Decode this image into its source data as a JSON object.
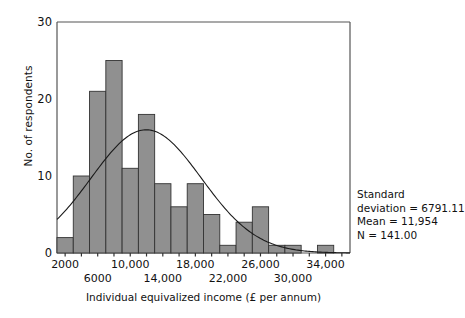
{
  "chart_data": {
    "type": "bar",
    "title": "",
    "subtitle": "",
    "xlabel": "Individual equivalized income (£ per annum)",
    "ylabel": "No. of respondents",
    "grid": false,
    "legend": "none",
    "histogram": true,
    "bin_width": 2000,
    "xlim": [
      1000,
      37000
    ],
    "ylim": [
      0,
      30
    ],
    "yticks": [
      0,
      10,
      20,
      30
    ],
    "ytick_labels": [
      "0",
      "10",
      "20",
      "30"
    ],
    "xticks": [
      2000,
      4000,
      6000,
      8000,
      10000,
      12000,
      14000,
      16000,
      18000,
      20000,
      22000,
      24000,
      26000,
      28000,
      30000,
      32000,
      34000,
      36000
    ],
    "xtick_labels_shown": [
      {
        "value": 2000,
        "label": "2000",
        "row": 0
      },
      {
        "value": 6000,
        "label": "6000",
        "row": 1
      },
      {
        "value": 10000,
        "label": "10,000",
        "row": 0
      },
      {
        "value": 14000,
        "label": "14,000",
        "row": 1
      },
      {
        "value": 18000,
        "label": "18,000",
        "row": 0
      },
      {
        "value": 22000,
        "label": "22,000",
        "row": 1
      },
      {
        "value": 26000,
        "label": "26,000",
        "row": 0
      },
      {
        "value": 30000,
        "label": "30,000",
        "row": 1
      },
      {
        "value": 34000,
        "label": "34,000",
        "row": 0
      }
    ],
    "categories": [
      "2000",
      "4000",
      "6000",
      "8000",
      "10,000",
      "12,000",
      "14,000",
      "16,000",
      "18,000",
      "20,000",
      "22,000",
      "24,000",
      "26,000",
      "28,000",
      "30,000",
      "32,000",
      "34,000",
      "36,000"
    ],
    "bin_centers": [
      2000,
      4000,
      6000,
      8000,
      10000,
      12000,
      14000,
      16000,
      18000,
      20000,
      22000,
      24000,
      26000,
      28000,
      30000,
      32000,
      34000,
      36000
    ],
    "values": [
      2,
      10,
      21,
      25,
      11,
      18,
      9,
      6,
      9,
      5,
      1,
      4,
      6,
      1,
      1,
      0,
      1,
      0
    ],
    "overlay_curve": {
      "name": "normal-distribution-curve",
      "type": "line",
      "distribution": "normal",
      "mean": 11954,
      "std_dev": 6791.11,
      "n": 141,
      "peak_value": 16.0
    },
    "bar_fill_color": "#909090",
    "bar_edge_color": "#333333",
    "curve_color": "#1a1a1a",
    "axis_color": "#555555",
    "text_color": "#111111"
  },
  "stats": {
    "line1": "Standard",
    "line2": "deviation = 6791.11",
    "line3": "Mean = 11,954",
    "line4": "N = 141.00",
    "standard_deviation": "6791.11",
    "mean": "11,954",
    "n": "141.00"
  }
}
